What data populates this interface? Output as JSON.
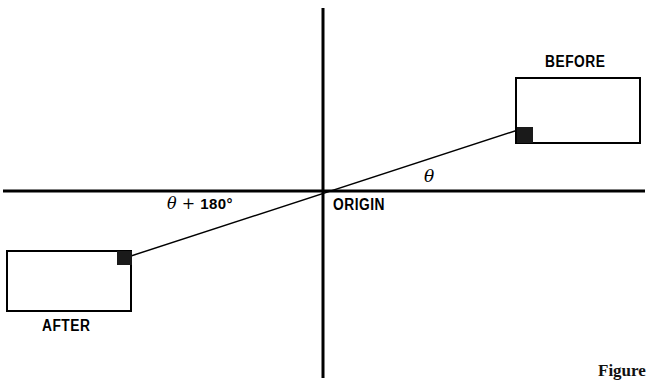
{
  "figure": {
    "caption": "Figure",
    "background_color": "#ffffff",
    "stroke_color": "#000000"
  },
  "axes": {
    "x_axis": {
      "name": "horizontal-axis",
      "y": 191,
      "x_start": 3,
      "x_end": 645,
      "thickness": 3
    },
    "y_axis": {
      "name": "vertical-axis",
      "x": 323,
      "y_start": 8,
      "y_end": 378,
      "thickness": 3
    },
    "origin": {
      "x": 323,
      "y": 191,
      "label": "ORIGIN"
    }
  },
  "labels": {
    "before": "BEFORE",
    "after": "AFTER",
    "origin": "ORIGIN",
    "theta": "θ",
    "theta_plus_180": "θ + 180°",
    "theta_symbol": "θ",
    "plus_symbol": "+",
    "degrees_value": "180°"
  },
  "shapes": {
    "before_rect": {
      "name": "before-rectangle",
      "x": 516,
      "y": 78,
      "width": 124,
      "height": 65,
      "fill": "none",
      "stroke": "#000000",
      "stroke_width": 2,
      "marker_corner": "bottom-left"
    },
    "after_rect": {
      "name": "after-rectangle",
      "x": 7,
      "y": 251,
      "width": 124,
      "height": 60,
      "fill": "none",
      "stroke": "#000000",
      "stroke_width": 2,
      "marker_corner": "top-right"
    },
    "before_marker": {
      "name": "before-corner-marker",
      "x": 517,
      "y": 127,
      "size": 16,
      "fill": "#1a1a1a"
    },
    "after_marker": {
      "name": "after-corner-marker",
      "x": 117,
      "y": 251,
      "size": 15,
      "fill": "#1a1a1a"
    },
    "ray_line": {
      "name": "rotation-ray",
      "x1": 131,
      "y1": 256,
      "x2": 518,
      "y2": 130,
      "stroke": "#000000",
      "stroke_width": 1.4
    }
  }
}
